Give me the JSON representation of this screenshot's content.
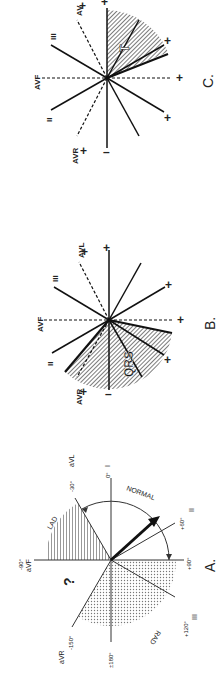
{
  "figure": {
    "panels": [
      {
        "id": "A",
        "caption": "A.",
        "axes": [
          {
            "angle": 0,
            "label": "0°",
            "lead": "I"
          },
          {
            "angle": -30,
            "label": "-30°",
            "lead": "aVL"
          },
          {
            "angle": -90,
            "label": "-90°",
            "lead": "aVF"
          },
          {
            "angle": -150,
            "label": "-150°",
            "lead": "aVR"
          },
          {
            "angle": 180,
            "label": "±180°",
            "lead": ""
          },
          {
            "angle": 120,
            "label": "+120°",
            "lead": "III"
          },
          {
            "angle": 90,
            "label": "+90°",
            "lead": ""
          },
          {
            "angle": 60,
            "label": "+60°",
            "lead": "II"
          }
        ],
        "regions": {
          "lad": "LAD",
          "rad": "RAD",
          "normal": "NORMAL",
          "indeterminate": "?"
        }
      },
      {
        "id": "B",
        "caption": "B.",
        "shaded_label": "QRS",
        "lead_labels": {
          "avf": "AVF",
          "avl": "AVL",
          "avr": "AVR",
          "ii": "II",
          "iii": "III"
        },
        "plus": "+",
        "minus": "–"
      },
      {
        "id": "C",
        "caption": "C.",
        "shaded_label": "T",
        "lead_labels": {
          "avf": "AVF",
          "avl": "AV",
          "avr": "AVR",
          "ii": "II",
          "iii": "III"
        },
        "plus": "+",
        "minus": "–"
      }
    ]
  }
}
